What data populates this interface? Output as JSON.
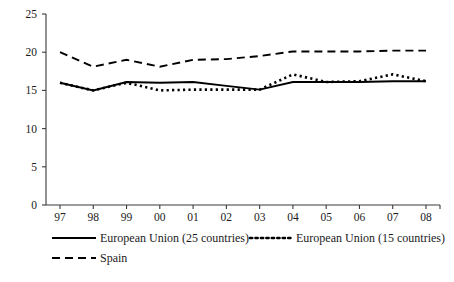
{
  "chart_data": {
    "type": "line",
    "title": "",
    "subtitle": "",
    "xlabel": "",
    "ylabel": "",
    "grid": false,
    "legend_position": "bottom",
    "categories": [
      "97",
      "98",
      "99",
      "00",
      "01",
      "02",
      "03",
      "04",
      "05",
      "06",
      "07",
      "08"
    ],
    "x_tick_labels": [
      "97",
      "98",
      "99",
      "00",
      "01",
      "02",
      "03",
      "04",
      "05",
      "06",
      "07",
      "08"
    ],
    "y_tick_labels": [
      "0",
      "5",
      "10",
      "15",
      "20",
      "25"
    ],
    "y_tick_values": [
      0,
      5,
      10,
      15,
      20,
      25
    ],
    "ylim": [
      0,
      25
    ],
    "series": [
      {
        "name": "European Union (25 countries)",
        "style": "solid",
        "color": "#000000",
        "values": [
          16.0,
          15.0,
          16.1,
          16.0,
          16.1,
          15.6,
          15.1,
          16.1,
          16.1,
          16.1,
          16.2,
          16.2
        ]
      },
      {
        "name": "European Union (15 countries)",
        "style": "dotted",
        "color": "#000000",
        "values": [
          16.0,
          15.0,
          16.0,
          15.0,
          15.1,
          15.1,
          15.1,
          17.1,
          16.1,
          16.2,
          17.1,
          16.2
        ]
      },
      {
        "name": "Spain",
        "style": "dashed",
        "color": "#000000",
        "values": [
          20.0,
          18.1,
          19.0,
          18.1,
          19.0,
          19.1,
          19.5,
          20.1,
          20.1,
          20.1,
          20.2,
          20.2
        ]
      }
    ]
  },
  "legend": {
    "entries": [
      {
        "label": "European Union (25 countries)",
        "style": "solid"
      },
      {
        "label": "European Union (15 countries)",
        "style": "dotted"
      },
      {
        "label": "Spain",
        "style": "dashed"
      }
    ]
  }
}
